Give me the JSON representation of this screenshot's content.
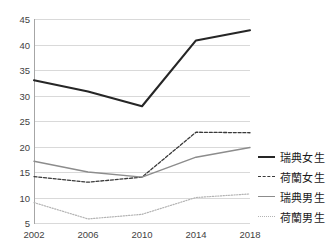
{
  "chart_data": {
    "type": "line",
    "title": "",
    "subtitle": "",
    "xlabel": "",
    "ylabel": "",
    "categories": [
      "2002",
      "2006",
      "2010",
      "2014",
      "2018"
    ],
    "x": [
      2002,
      2006,
      2010,
      2014,
      2018
    ],
    "ylim": [
      5,
      45
    ],
    "yticks": [
      5,
      10,
      15,
      20,
      25,
      30,
      35,
      40,
      45
    ],
    "ytick_labels": [
      "5",
      "10",
      "15",
      "20",
      "25",
      "30",
      "35",
      "40",
      "45"
    ],
    "grid": true,
    "grid_axis": "y",
    "legend_position": "right",
    "series": [
      {
        "name": "瑞典女生",
        "values": [
          33.0,
          30.8,
          27.9,
          40.8,
          42.8
        ],
        "color": "#262626",
        "style": "solid",
        "width": 2.1
      },
      {
        "name": "荷蘭女生",
        "values": [
          14.1,
          13.0,
          14.0,
          22.8,
          22.7
        ],
        "color": "#3a3a3a",
        "style": "dashed",
        "width": 1.3
      },
      {
        "name": "瑞典男生",
        "values": [
          17.1,
          15.0,
          14.0,
          17.9,
          19.8
        ],
        "color": "#8c8c8c",
        "style": "solid",
        "width": 1.4
      },
      {
        "name": "荷蘭男生",
        "values": [
          9.0,
          5.8,
          6.7,
          10.0,
          10.7
        ],
        "color": "#b3b3b3",
        "style": "dotted",
        "width": 1.2
      }
    ]
  },
  "axis": {
    "y_labels": [
      "45",
      "40",
      "35",
      "30",
      "25",
      "20",
      "15",
      "10",
      "5"
    ],
    "x_labels": [
      "2002",
      "2006",
      "2010",
      "2014",
      "2018"
    ]
  },
  "legend": {
    "items": [
      {
        "label": "瑞典女生",
        "style": "solid-dark"
      },
      {
        "label": "荷蘭女生",
        "style": "dashed-dark"
      },
      {
        "label": "瑞典男生",
        "style": "solid-gray"
      },
      {
        "label": "荷蘭男生",
        "style": "dotted-light"
      }
    ]
  },
  "colors": {
    "gridline": "#d9d9d9",
    "axis": "#a6a6a6",
    "text": "#3f3f3f",
    "background": "#ffffff"
  }
}
